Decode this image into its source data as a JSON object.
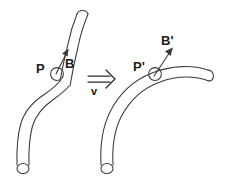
{
  "figure": {
    "title": "",
    "background_color": "#ffffff",
    "stroke_color": "#3a3a3a",
    "text_color": "#1a1a1a",
    "width": 237,
    "height": 185
  },
  "labels": {
    "point_left": "P",
    "vector_left": "B",
    "point_right": "P'",
    "vector_right": "B'",
    "map": "v"
  },
  "arrow": {
    "glyph": "double-right-arrow",
    "label": "v"
  },
  "panels": [
    {
      "name": "before",
      "point_label": "P",
      "vector_label": "B",
      "shape": "kinked-tube"
    },
    {
      "name": "after",
      "point_label": "P'",
      "vector_label": "B'",
      "shape": "smooth-curved-tube"
    }
  ]
}
